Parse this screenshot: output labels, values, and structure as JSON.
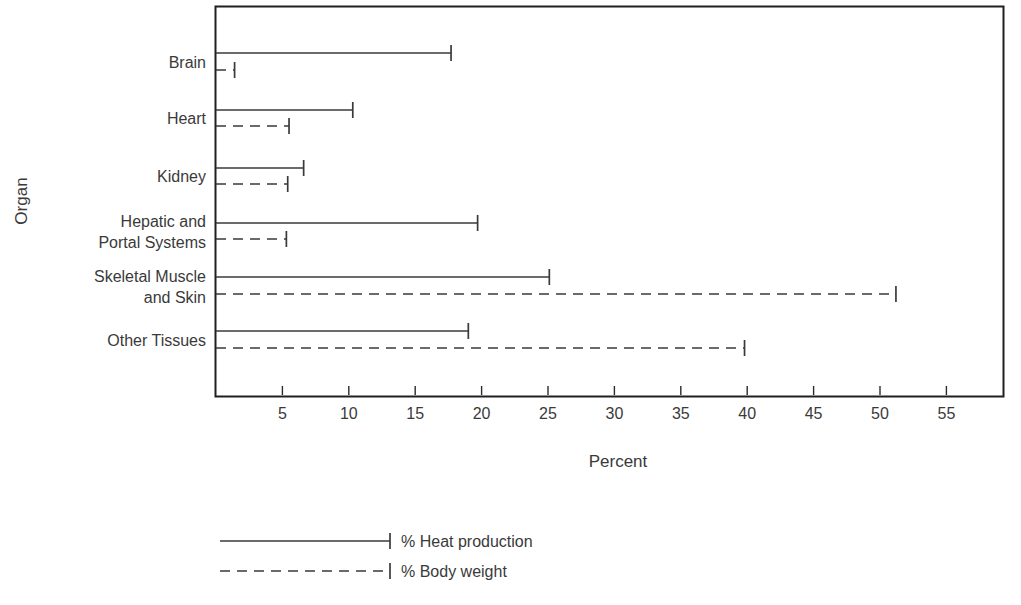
{
  "chart_data": {
    "type": "bar",
    "orientation": "horizontal",
    "title": "",
    "xlabel": "Percent",
    "ylabel": "Organ",
    "xlim": [
      0,
      59.2
    ],
    "ylim": [
      0,
      6
    ],
    "grid": false,
    "legend_position": "below-plot-left",
    "xticks": [
      5,
      10,
      15,
      20,
      25,
      30,
      35,
      40,
      45,
      50,
      55
    ],
    "xtick_labels": [
      "5",
      "10",
      "15",
      "20",
      "25",
      "30",
      "35",
      "40",
      "45",
      "50",
      "55"
    ],
    "categories": [
      "Brain",
      "Heart",
      "Kidney",
      "Hepatic and Portal Systems",
      "Skeletal Muscle and Skin",
      "Other Tissues"
    ],
    "category_label_lines": [
      [
        "Brain"
      ],
      [
        "Heart"
      ],
      [
        "Kidney"
      ],
      [
        "Hepatic and",
        "Portal Systems"
      ],
      [
        "Skeletal Muscle",
        "and Skin"
      ],
      [
        "Other Tissues"
      ]
    ],
    "series": [
      {
        "name": "% Heat production",
        "style": "solid",
        "values": [
          17.7,
          10.3,
          6.6,
          19.7,
          25.1,
          19.0
        ]
      },
      {
        "name": "% Body weight",
        "style": "dashed",
        "values": [
          1.4,
          5.5,
          5.4,
          5.3,
          51.2,
          39.8
        ]
      }
    ],
    "colors": {
      "line": "#3a3a3a",
      "frame": "#1f1f1f",
      "background": "#ffffff",
      "text": "#3a3a3a"
    }
  },
  "axis": {
    "x_title": "Percent",
    "y_title": "Organ"
  },
  "legend": {
    "items": [
      {
        "label": "% Heat production",
        "style": "solid"
      },
      {
        "label": "% Body weight",
        "style": "dashed"
      }
    ]
  },
  "ticks": {
    "x": [
      "5",
      "10",
      "15",
      "20",
      "25",
      "30",
      "35",
      "40",
      "45",
      "50",
      "55"
    ]
  }
}
